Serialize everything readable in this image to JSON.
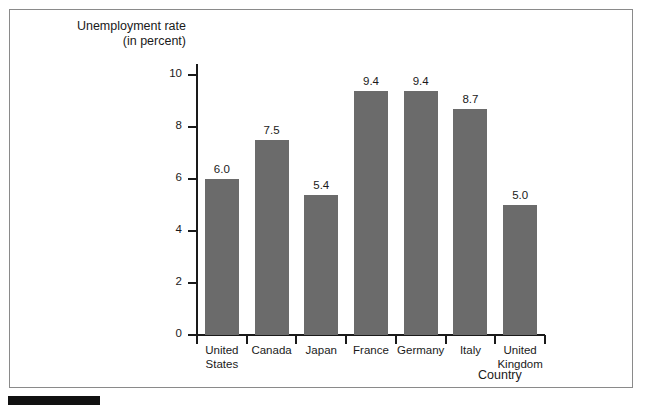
{
  "chart_data": {
    "type": "bar",
    "title": "",
    "ylabel": "Unemployment rate\n(in percent)",
    "ylabel_line1": "Unemployment rate",
    "ylabel_line2": "(in percent)",
    "xlabel": "Country",
    "categories": [
      "United\nStates",
      "Canada",
      "Japan",
      "France",
      "Germany",
      "Italy",
      "United\nKingdom"
    ],
    "category_labels": [
      {
        "line1": "United",
        "line2": "States"
      },
      {
        "line1": "Canada",
        "line2": ""
      },
      {
        "line1": "Japan",
        "line2": ""
      },
      {
        "line1": "France",
        "line2": ""
      },
      {
        "line1": "Germany",
        "line2": ""
      },
      {
        "line1": "Italy",
        "line2": ""
      },
      {
        "line1": "United",
        "line2": "Kingdom"
      }
    ],
    "values": [
      6.0,
      7.5,
      5.4,
      9.4,
      9.4,
      8.7,
      5.0
    ],
    "value_labels": [
      "6.0",
      "7.5",
      "5.4",
      "9.4",
      "9.4",
      "8.7",
      "5.0"
    ],
    "ylim": [
      0,
      11
    ],
    "yticks": [
      0,
      2,
      4,
      6,
      8,
      10
    ],
    "ytick_labels": [
      "0",
      "2",
      "4",
      "6",
      "8",
      "10"
    ],
    "grid": false,
    "legend": null,
    "bar_color": "#6b6b6b",
    "axis_color": "#1a1a1a",
    "background": "#ffffff"
  }
}
